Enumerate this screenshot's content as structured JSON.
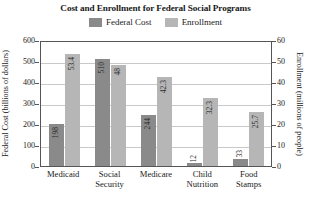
{
  "chart_data": {
    "type": "bar",
    "title": "Cost and Enrollment for Federal Social Programs",
    "categories": [
      "Medicaid",
      "Social Security",
      "Medicare",
      "Child Nutrition",
      "Food Stamps"
    ],
    "category_lines": [
      [
        "Medicaid"
      ],
      [
        "Social",
        "Security"
      ],
      [
        "Medicare"
      ],
      [
        "Child",
        "Nutrition"
      ],
      [
        "Food",
        "Stamps"
      ]
    ],
    "series": [
      {
        "name": "Federal Cost",
        "color": "#8a8a8a",
        "axis": "left",
        "values": [
          198,
          510,
          244,
          12,
          33
        ],
        "labels": [
          "198",
          "510",
          "244",
          "12",
          "33"
        ]
      },
      {
        "name": "Enrollment",
        "color": "#b6b6b6",
        "axis": "right",
        "values": [
          53.4,
          48,
          42.3,
          32.3,
          25.7
        ],
        "labels": [
          "53.4",
          "48",
          "42.3",
          "32.3",
          "25.7"
        ]
      }
    ],
    "xlabel": "",
    "ylabel": "Federal Cost (billions of dollars)",
    "ylabel_right": "Enrollment (millions of people)",
    "ylim": [
      0,
      600
    ],
    "ylim_right": [
      0,
      60
    ],
    "yticks": [
      0,
      100,
      200,
      300,
      400,
      500,
      600
    ],
    "yticks_right": [
      0,
      10,
      20,
      30,
      40,
      50,
      60
    ],
    "grid": true,
    "legend_position": "top-center"
  },
  "legend": {
    "entries": [
      {
        "label": "Federal Cost",
        "color": "#8a8a8a"
      },
      {
        "label": "Enrollment",
        "color": "#b6b6b6"
      }
    ]
  }
}
